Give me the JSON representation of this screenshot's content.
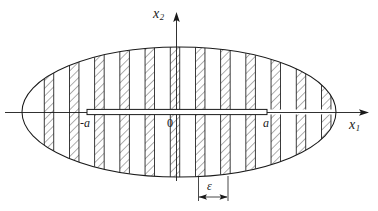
{
  "figure": {
    "type": "mechanics-diagram",
    "stroke_color": "#1a1a1a",
    "fill_color": "#ffffff",
    "axes": {
      "vertical": {
        "label": "x",
        "subscript": "2",
        "name": "x2-axis"
      },
      "horizontal": {
        "label": "x",
        "subscript": "1",
        "name": "x1-axis"
      }
    },
    "labels": {
      "origin": "0",
      "crack_left": "-a",
      "crack_right": "a",
      "strip_width": "ε"
    },
    "geometry": {
      "ellipse_center_x": 179,
      "ellipse_center_y": 112,
      "ellipse_rx": 157,
      "ellipse_ry": 65,
      "crack_x_left": 87,
      "crack_x_right": 267,
      "crack_half_height": 2.6,
      "band_width": 9.5,
      "band_pitch": 25.2,
      "band_centers": [
        49,
        74.2,
        99.4,
        124.6,
        149.8,
        175,
        200.2,
        225.4,
        250.6,
        275.8,
        301,
        326.2
      ],
      "hatch_spacing": 5.5,
      "dimension_y": 197,
      "dimension_x_left": 198,
      "dimension_x_right": 228
    }
  }
}
